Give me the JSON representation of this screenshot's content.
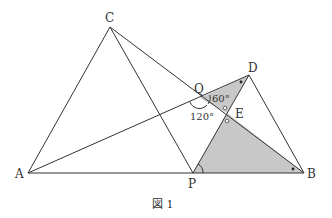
{
  "figure": {
    "caption": "図 1",
    "colors": {
      "line": "#333333",
      "shade": "#c8c8c8",
      "background": "#ffffff"
    },
    "points": {
      "A": {
        "label": "A",
        "x": 28,
        "y": 173
      },
      "C": {
        "label": "C",
        "x": 110,
        "y": 27
      },
      "P": {
        "label": "P",
        "x": 193,
        "y": 173
      },
      "B": {
        "label": "B",
        "x": 304,
        "y": 173
      },
      "D": {
        "label": "D",
        "x": 249,
        "y": 75
      },
      "Q": {
        "label": "Q",
        "x": 200,
        "y": 98
      },
      "E": {
        "label": "E",
        "x": 227,
        "y": 113
      }
    },
    "angles": {
      "q_upper": "60°",
      "q_lower": "120°"
    },
    "segments": [
      "AC",
      "CP",
      "AP",
      "PB",
      "CB",
      "AD",
      "PD",
      "DB"
    ],
    "shaded_regions": [
      "QDE",
      "PEB"
    ],
    "marks": {
      "equal_angle_dots": [
        "at D in triangle QDE",
        "at B in triangle PEB"
      ],
      "vertical_angle_circles": [
        "above E",
        "below E"
      ],
      "angle_arc_at_P": true
    }
  }
}
